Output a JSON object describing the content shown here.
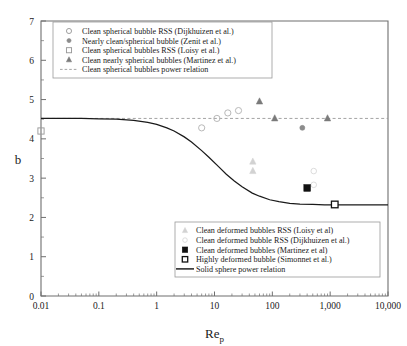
{
  "chart_data": {
    "type": "scatter",
    "title": "",
    "xlabel": "Re_p",
    "xlabel_base": "Re",
    "xlabel_sub": "p",
    "ylabel": "b",
    "xscale": "log",
    "yscale": "linear",
    "xlim": [
      0.01,
      10000
    ],
    "ylim": [
      0,
      7
    ],
    "grid": false,
    "xticks": [
      0.01,
      0.1,
      1,
      10,
      100,
      1000,
      10000
    ],
    "xtick_labels": [
      "0.01",
      "0.1",
      "1",
      "10",
      "100",
      "1,000",
      "10,000"
    ],
    "yticks": [
      0,
      1,
      2,
      3,
      4,
      5,
      6,
      7
    ],
    "ytick_labels": [
      "0",
      "1",
      "2",
      "3",
      "4",
      "5",
      "6",
      "7"
    ],
    "minor_ticks": true,
    "series": [
      {
        "name": "Clean spherical bubble RSS (Dijkhuizen et al.)",
        "marker": "open-circle",
        "color": "#b4b4b4",
        "points": [
          {
            "x": 6.0,
            "y": 4.28
          },
          {
            "x": 11.0,
            "y": 4.52
          },
          {
            "x": 17.0,
            "y": 4.66
          },
          {
            "x": 26.0,
            "y": 4.72
          }
        ]
      },
      {
        "name": "Nearly clean/spherical bubble (Zenit et al.)",
        "marker": "filled-circle",
        "color": "#8c8c8c",
        "points": [
          {
            "x": 330.0,
            "y": 4.28
          }
        ]
      },
      {
        "name": "Clean spherical bubbles RSS (Loisy et al.)",
        "marker": "open-square",
        "color": "#9a9a9a",
        "points": [
          {
            "x": 0.01,
            "y": 4.2
          }
        ]
      },
      {
        "name": "Clean nearly spherical bubbles (Martinez et al.)",
        "marker": "filled-triangle",
        "color": "#7a7a7a",
        "points": [
          {
            "x": 60.0,
            "y": 4.95
          },
          {
            "x": 110.0,
            "y": 4.52
          },
          {
            "x": 900.0,
            "y": 4.52
          }
        ]
      },
      {
        "name": "Clean deformed bubbles RSS (Loisy et al)",
        "marker": "light-triangle",
        "color": "#d2d2d2",
        "points": [
          {
            "x": 46.0,
            "y": 3.42
          },
          {
            "x": 46.0,
            "y": 3.18
          }
        ]
      },
      {
        "name": "Clean deformed bubble RSS (Dijkhuizen et al.)",
        "marker": "light-circle",
        "color": "#d8d8d8",
        "points": [
          {
            "x": 520.0,
            "y": 3.18
          },
          {
            "x": 520.0,
            "y": 2.83
          }
        ]
      },
      {
        "name": "Clean deformed bubbles (Martinez et al)",
        "marker": "filled-square",
        "color": "#111111",
        "points": [
          {
            "x": 400.0,
            "y": 2.75
          }
        ]
      },
      {
        "name": "Highly deformed bubble (Simonnet et al.)",
        "marker": "open-square-dark",
        "color": "#111111",
        "points": [
          {
            "x": 1200.0,
            "y": 2.33
          }
        ]
      }
    ],
    "lines": [
      {
        "name": "Clean spherical bubbles power relation",
        "style": "dashed",
        "color": "#9a9a9a",
        "value": 4.52,
        "kind": "horizontal"
      },
      {
        "name": "Solid sphere power relation",
        "style": "solid",
        "color": "#1a1a1a",
        "kind": "curve",
        "curve_points": [
          {
            "x": 0.01,
            "y": 4.52
          },
          {
            "x": 0.02,
            "y": 4.52
          },
          {
            "x": 0.05,
            "y": 4.52
          },
          {
            "x": 0.1,
            "y": 4.51
          },
          {
            "x": 0.2,
            "y": 4.5
          },
          {
            "x": 0.4,
            "y": 4.47
          },
          {
            "x": 0.7,
            "y": 4.42
          },
          {
            "x": 1.0,
            "y": 4.37
          },
          {
            "x": 1.5,
            "y": 4.28
          },
          {
            "x": 2.0,
            "y": 4.2
          },
          {
            "x": 3.0,
            "y": 4.05
          },
          {
            "x": 4.0,
            "y": 3.92
          },
          {
            "x": 6.0,
            "y": 3.7
          },
          {
            "x": 8.0,
            "y": 3.53
          },
          {
            "x": 12.0,
            "y": 3.28
          },
          {
            "x": 16.0,
            "y": 3.1
          },
          {
            "x": 22.0,
            "y": 2.93
          },
          {
            "x": 30.0,
            "y": 2.78
          },
          {
            "x": 45.0,
            "y": 2.62
          },
          {
            "x": 60.0,
            "y": 2.54
          },
          {
            "x": 90.0,
            "y": 2.45
          },
          {
            "x": 130.0,
            "y": 2.4
          },
          {
            "x": 200.0,
            "y": 2.36
          },
          {
            "x": 300.0,
            "y": 2.34
          },
          {
            "x": 500.0,
            "y": 2.33
          },
          {
            "x": 800.0,
            "y": 2.32
          },
          {
            "x": 1200.0,
            "y": 2.32
          },
          {
            "x": 2000.0,
            "y": 2.32
          },
          {
            "x": 4000.0,
            "y": 2.32
          },
          {
            "x": 10000.0,
            "y": 2.32
          }
        ]
      }
    ],
    "legend_top": {
      "position": "top-left-inside",
      "entries": [
        {
          "marker": "open-circle",
          "label": "Clean spherical bubble RSS (Dijkhuizen et al.)"
        },
        {
          "marker": "filled-circle",
          "label": "Nearly clean/spherical bubble (Zenit et al.)"
        },
        {
          "marker": "open-square",
          "label": "Clean spherical bubbles RSS (Loisy et al.)"
        },
        {
          "marker": "filled-triangle",
          "label": "Clean nearly spherical bubbles (Martinez et al.)"
        },
        {
          "marker": "dashed-line",
          "label": "Clean spherical bubbles power relation"
        }
      ]
    },
    "legend_bottom": {
      "position": "bottom-right-inside",
      "entries": [
        {
          "marker": "light-triangle",
          "label": "Clean deformed bubbles RSS (Loisy et al)"
        },
        {
          "marker": "light-circle",
          "label": "Clean deformed bubble RSS (Dijkhuizen et al.)"
        },
        {
          "marker": "filled-square",
          "label": "Clean deformed bubbles (Martinez et al)"
        },
        {
          "marker": "open-square-dark",
          "label": "Highly deformed bubble (Simonnet et al.)"
        },
        {
          "marker": "solid-line",
          "label": "Solid sphere power relation"
        }
      ]
    }
  }
}
